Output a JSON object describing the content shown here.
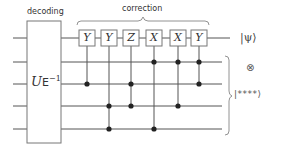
{
  "labels": {
    "decoding": "decoding",
    "correction": "correction"
  },
  "decoder": {
    "label_main": "U",
    "label_sub": "E",
    "label_sup": "−1"
  },
  "wires_y": [
    38,
    62,
    84,
    106,
    129
  ],
  "gates": [
    {
      "label": "Y",
      "x": 87,
      "controls": [
        3
      ]
    },
    {
      "label": "Y",
      "x": 109,
      "controls": [
        4,
        5
      ]
    },
    {
      "label": "Z",
      "x": 131,
      "controls": [
        3,
        4
      ]
    },
    {
      "label": "X",
      "x": 154,
      "controls": [
        2,
        5
      ]
    },
    {
      "label": "X",
      "x": 178,
      "controls": [
        2,
        4
      ]
    },
    {
      "label": "Y",
      "x": 199,
      "controls": [
        2,
        3
      ]
    }
  ],
  "outputs": {
    "psi": "|ψ⟩",
    "tensor": "⊗",
    "ancilla": "|****⟩"
  }
}
